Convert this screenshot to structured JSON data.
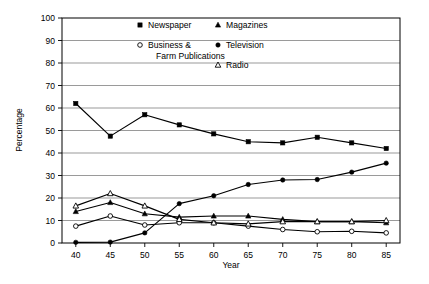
{
  "chart_data": {
    "type": "line",
    "title": "",
    "xlabel": "Year",
    "ylabel": "Percentage",
    "xlim": [
      38,
      87
    ],
    "ylim": [
      0,
      100
    ],
    "grid": true,
    "legend_position": "top-inside",
    "x": [
      40,
      45,
      50,
      55,
      60,
      65,
      70,
      75,
      80,
      85
    ],
    "xticks": [
      "40",
      "45",
      "50",
      "55",
      "60",
      "65",
      "70",
      "75",
      "80",
      "85"
    ],
    "yticks": [
      "0",
      "10",
      "20",
      "30",
      "40",
      "50",
      "60",
      "70",
      "80",
      "90",
      "100"
    ],
    "series": [
      {
        "name": "Newspaper",
        "marker": "filled-square",
        "values": [
          62.0,
          47.5,
          57.0,
          52.5,
          48.5,
          45.0,
          44.5,
          47.0,
          44.5,
          42.0
        ]
      },
      {
        "name": "Business & Farm Publications",
        "marker": "open-circle",
        "values": [
          7.5,
          12.0,
          8.0,
          9.0,
          9.0,
          7.5,
          6.0,
          5.0,
          5.2,
          4.5
        ]
      },
      {
        "name": "Magazines",
        "marker": "filled-triangle",
        "values": [
          14.0,
          18.0,
          13.0,
          11.5,
          12.0,
          12.0,
          10.5,
          9.5,
          9.5,
          9.0
        ]
      },
      {
        "name": "Television",
        "marker": "filled-circle",
        "values": [
          0.3,
          0.4,
          4.5,
          17.5,
          21.0,
          26.0,
          28.0,
          28.2,
          31.5,
          35.5
        ]
      },
      {
        "name": "Radio",
        "marker": "open-triangle",
        "values": [
          16.5,
          22.0,
          16.5,
          10.5,
          9.0,
          8.5,
          9.5,
          9.5,
          9.5,
          10.0
        ]
      }
    ]
  },
  "legend": {
    "entries": [
      {
        "label": "Newspaper",
        "marker": "filled-square"
      },
      {
        "label": "Business &",
        "label2": "Farm Publications",
        "marker": "open-circle"
      },
      {
        "label": "Magazines",
        "marker": "filled-triangle"
      },
      {
        "label": "Television",
        "marker": "filled-circle"
      },
      {
        "label": "Radio",
        "marker": "open-triangle"
      }
    ]
  },
  "axes": {
    "y_title": "Percentage",
    "x_title": "Year"
  }
}
